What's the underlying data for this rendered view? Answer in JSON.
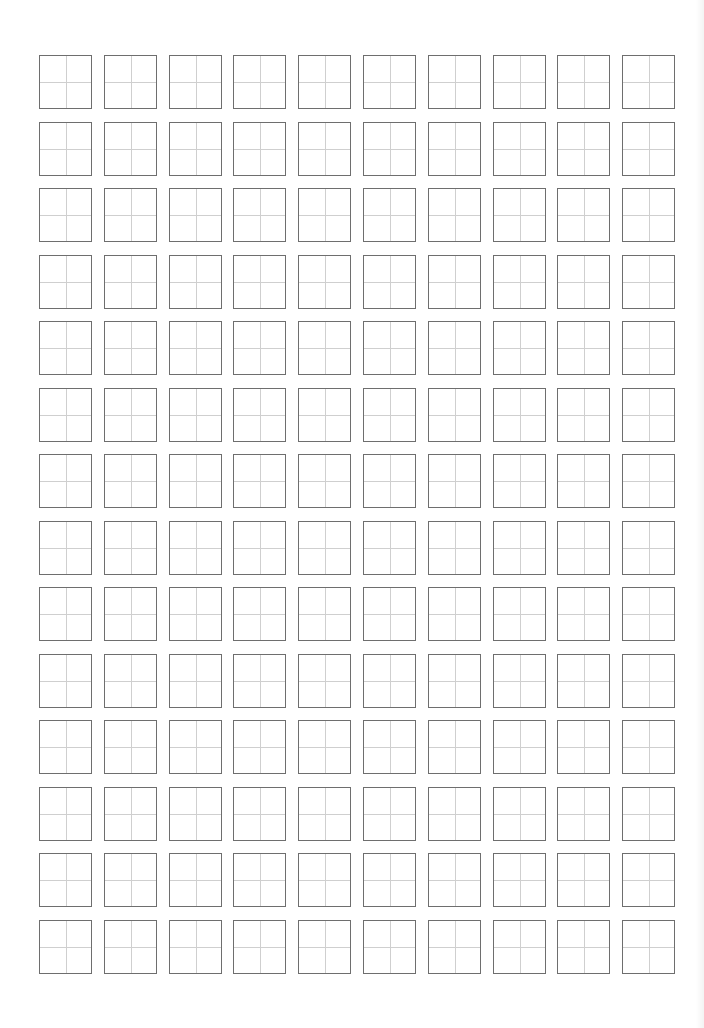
{
  "page": {
    "type": "tianzige-practice-sheet",
    "rows": 14,
    "columns": 10,
    "box_size_px": 53,
    "col_pitch_px": 64.8,
    "row_pitch_px": 66.5,
    "colors": {
      "background": "#ffffff",
      "box_border": "#6e6e6e",
      "guide_lines": "#cfcfcf"
    }
  }
}
